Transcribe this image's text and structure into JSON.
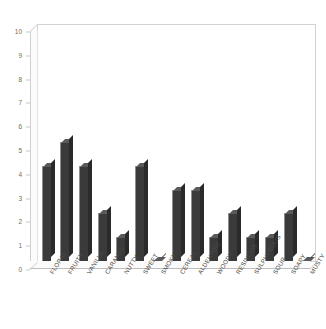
{
  "chart_data": {
    "type": "bar",
    "title": "",
    "xlabel": "",
    "ylabel": "",
    "ylim": [
      0,
      10
    ],
    "grid": false,
    "legend": null,
    "y_ticks": [
      0,
      1,
      2,
      3,
      4,
      5,
      6,
      7,
      8,
      9,
      10
    ],
    "categories": [
      "FLORAL",
      "FRUITY",
      "VANILLA",
      "CARAMEL",
      "NUTTY",
      "SWEET",
      "SMOKY",
      "CEREAL",
      "ALDEHYDIC",
      "WOODY",
      "RESINOUS",
      "SULPHUROUS",
      "SOUR",
      "SOAPY",
      "MUSTY"
    ],
    "values": [
      4,
      5,
      4,
      2,
      1,
      4,
      0,
      3,
      3,
      1,
      2,
      1,
      1,
      2,
      0
    ],
    "bar_color": "#3a3a3a",
    "frame_color": "#d2d2d2",
    "tick_label_color": "#6d6d6d"
  }
}
